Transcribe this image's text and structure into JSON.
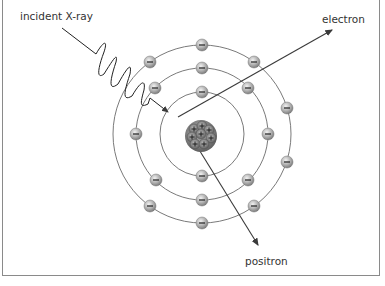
{
  "diagram": {
    "labels": {
      "incident": "incident X-ray",
      "electron": "electron",
      "positron": "positron"
    },
    "electron_symbol": "−",
    "proton_symbol": "+",
    "colors": {
      "orbit": "#7a7a7a",
      "electron_fill": "#b5b5b5",
      "nucleus": "#8c8c8c",
      "line": "#3a3a3a",
      "frame": "#8a8a8a"
    },
    "atom": {
      "center": [
        202,
        134
      ],
      "orbit_radii": [
        42,
        66,
        89
      ],
      "electrons_per_shell": [
        2,
        8,
        11
      ]
    }
  }
}
